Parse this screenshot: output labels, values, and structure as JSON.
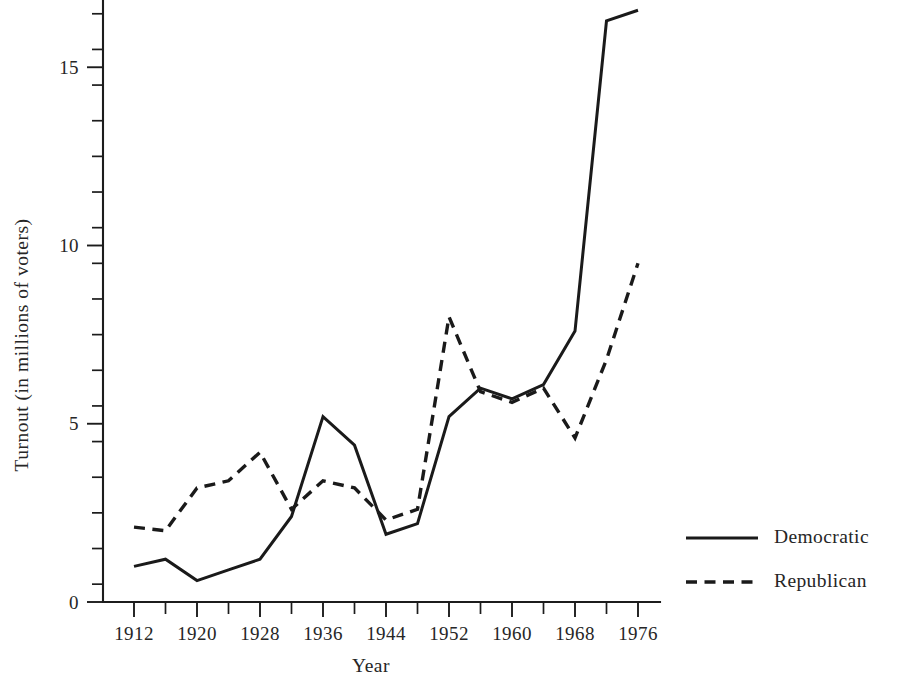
{
  "chart_data": {
    "type": "line",
    "title": "",
    "xlabel": "Year",
    "ylabel": "Turnout (in millions of voters)",
    "xlim": [
      1912,
      1976
    ],
    "ylim": [
      0,
      17
    ],
    "grid": false,
    "legend_position": "right",
    "x": [
      1912,
      1916,
      1920,
      1924,
      1928,
      1932,
      1936,
      1940,
      1944,
      1948,
      1952,
      1956,
      1960,
      1964,
      1968,
      1972,
      1976
    ],
    "x_tick_labels": [
      "1912",
      "1920",
      "1928",
      "1936",
      "1944",
      "1952",
      "1960",
      "1968",
      "1976"
    ],
    "x_tick_values": [
      1912,
      1920,
      1928,
      1936,
      1944,
      1952,
      1960,
      1968,
      1976
    ],
    "x_minor_tick_values": [
      1916,
      1924,
      1932,
      1940,
      1948,
      1956,
      1964,
      1972
    ],
    "y_tick_labels": [
      "0",
      "5",
      "10",
      "15"
    ],
    "y_tick_values": [
      0,
      5,
      10,
      15
    ],
    "y_minor_tick_values": [
      0.5,
      1.5,
      2.5,
      3.5,
      4.5,
      5.5,
      6.5,
      7.5,
      8.5,
      9.5,
      10.5,
      11.5,
      12.5,
      13.5,
      14.5,
      15.5,
      16.5
    ],
    "series": [
      {
        "name": "Democratic",
        "style": "solid",
        "color": "#1a1a1a",
        "values": [
          1.0,
          1.2,
          0.6,
          0.9,
          1.2,
          2.4,
          5.2,
          4.4,
          1.9,
          2.2,
          5.2,
          6.0,
          5.7,
          6.1,
          7.6,
          16.3,
          16.6
        ]
      },
      {
        "name": "Republican",
        "style": "dashed",
        "color": "#1a1a1a",
        "values": [
          2.1,
          2.0,
          3.2,
          3.4,
          4.2,
          2.6,
          3.4,
          3.2,
          2.3,
          2.6,
          8.0,
          5.9,
          5.6,
          6.0,
          4.6,
          6.8,
          9.5
        ]
      }
    ]
  },
  "legend": {
    "entries": [
      {
        "label": "Democratic",
        "style": "solid"
      },
      {
        "label": "Republican",
        "style": "dashed"
      }
    ]
  },
  "axes": {
    "x_title": "Year",
    "y_title": "Turnout (in millions of voters)"
  }
}
